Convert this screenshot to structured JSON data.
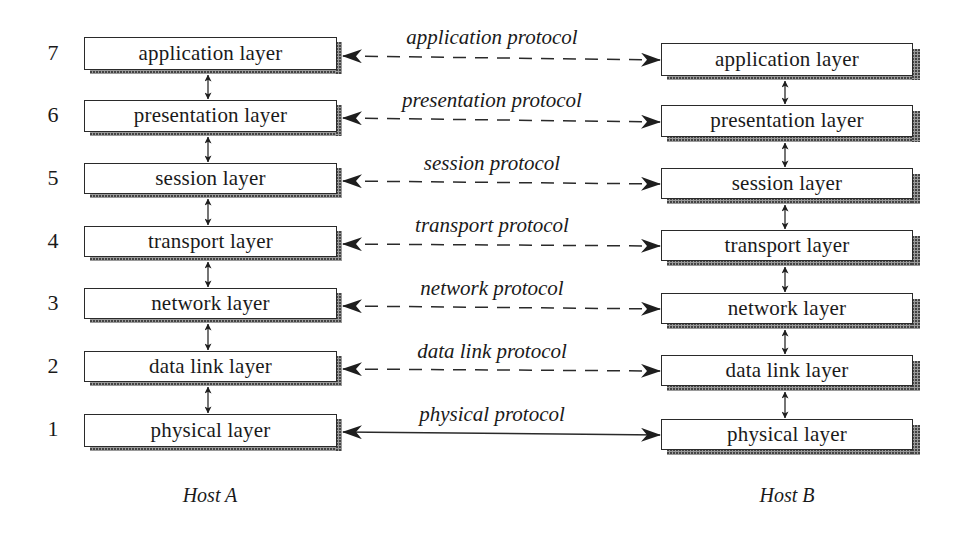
{
  "diagram": {
    "type": "OSI reference model protocol stack",
    "layer_numbers": [
      "7",
      "6",
      "5",
      "4",
      "3",
      "2",
      "1"
    ],
    "host_a": {
      "label": "Host A",
      "layers": [
        "application layer",
        "presentation layer",
        "session layer",
        "transport layer",
        "network layer",
        "data link layer",
        "physical layer"
      ]
    },
    "host_b": {
      "label": "Host B",
      "layers": [
        "application layer",
        "presentation layer",
        "session layer",
        "transport layer",
        "network layer",
        "data link layer",
        "physical layer"
      ]
    },
    "protocols": [
      {
        "label": "application protocol",
        "line": "dashed"
      },
      {
        "label": "presentation protocol",
        "line": "dashed"
      },
      {
        "label": "session protocol",
        "line": "dashed"
      },
      {
        "label": "transport protocol",
        "line": "dashed"
      },
      {
        "label": "network protocol",
        "line": "dashed"
      },
      {
        "label": "data link protocol",
        "line": "dashed"
      },
      {
        "label": "physical protocol",
        "line": "solid"
      }
    ],
    "colors": {
      "stroke": "#2a2a2a",
      "background": "#ffffff",
      "shadow": "#9a9a9a"
    }
  }
}
